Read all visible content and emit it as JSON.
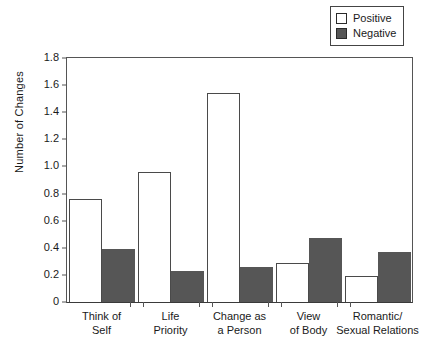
{
  "chart_data": {
    "type": "bar",
    "title": "",
    "subtitle": "",
    "xlabel": "",
    "ylabel": "Number of Changes",
    "ylim": [
      0,
      1.8
    ],
    "ytick_values": [
      0,
      0.2,
      0.4,
      0.6,
      0.8,
      1.0,
      1.2,
      1.4,
      1.6,
      1.8
    ],
    "ytick_labels": [
      "0",
      "0.2",
      "0.4",
      "0.6",
      "0.8",
      "1.0",
      "1.2",
      "1.4",
      "1.6",
      "1.8"
    ],
    "grid": false,
    "legend_position": "top-right",
    "categories": [
      "Think of\nSelf",
      "Life\nPriority",
      "Change as\na Person",
      "View\nof Body",
      "Romantic/\nSexual Relations"
    ],
    "category_lines": [
      [
        "Think of",
        "Self"
      ],
      [
        "Life",
        "Priority"
      ],
      [
        "Change as",
        "a Person"
      ],
      [
        "View",
        "of Body"
      ],
      [
        "Romantic/",
        "Sexual Relations"
      ]
    ],
    "series": [
      {
        "name": "Positive",
        "color": "#ffffff",
        "edge_color": "#4a4a4a",
        "values": [
          0.76,
          0.96,
          1.54,
          0.29,
          0.19
        ]
      },
      {
        "name": "Negative",
        "color": "#565656",
        "edge_color": "#565656",
        "values": [
          0.39,
          0.23,
          0.26,
          0.47,
          0.37
        ]
      }
    ]
  },
  "legend": {
    "items": [
      {
        "label": "Positive",
        "swatch": "positive"
      },
      {
        "label": "Negative",
        "swatch": "negative"
      }
    ]
  },
  "axes": {
    "y_title": "Number of Changes"
  }
}
